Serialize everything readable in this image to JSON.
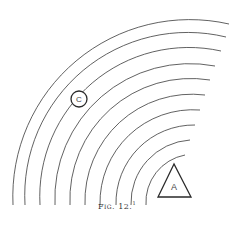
{
  "figure": {
    "caption": "Fig. 12.",
    "footnote_mark": "1",
    "source_label": "A",
    "target_label": "C",
    "arc_count": 10,
    "colors": {
      "line": "#3a3a3a",
      "background": "#ffffff"
    }
  }
}
